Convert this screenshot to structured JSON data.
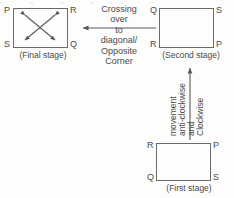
{
  "diagram": {
    "line_color": "#6b6b6b",
    "text_color": "#4a4a4a",
    "background": "#fdfdfc",
    "top_edge_artifact": "o o o o o o"
  },
  "stages": {
    "final": {
      "caption": "(Final stage)",
      "corners": {
        "top_left": "P",
        "top_right": "R",
        "bottom_left": "S",
        "bottom_right": "Q"
      },
      "inner_marks": "crossing-double-headed-diagonal-arrows"
    },
    "second": {
      "caption": "(Second stage)",
      "corners": {
        "top_left": "Q",
        "top_right": "S",
        "bottom_left": "R",
        "bottom_right": "P"
      },
      "inner_marks": "none"
    },
    "first": {
      "caption": "(First stage)",
      "corners": {
        "top_left": "R",
        "top_right": "P",
        "bottom_left": "Q",
        "bottom_right": "S"
      },
      "inner_marks": "none"
    }
  },
  "transitions": {
    "second_to_final": {
      "direction": "left",
      "lines": [
        "Crossing",
        "over",
        "to",
        "diagonal/",
        "Opposite",
        "Corner"
      ]
    },
    "first_to_second": {
      "direction": "up",
      "lines": [
        "Clockwise",
        "and",
        "anti-clockwise",
        "movement"
      ]
    }
  }
}
